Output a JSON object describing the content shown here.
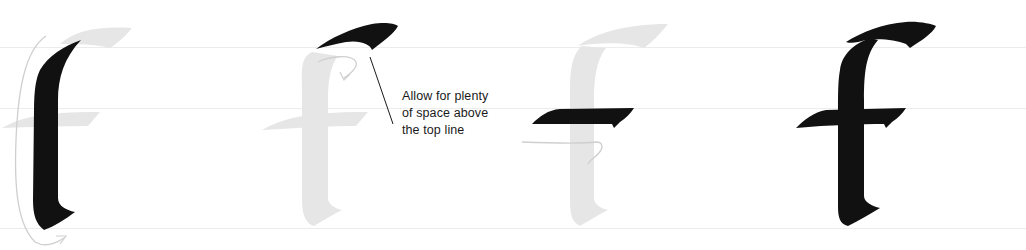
{
  "diagram": {
    "colors": {
      "ink": "#111111",
      "ghost_letter": "#e6e6e6",
      "guide_arrow": "#cfcfcf",
      "guideline": "#ececec",
      "text": "#1a1a1a"
    },
    "guidelines_y": [
      47,
      108,
      228
    ],
    "steps": [
      {
        "index": 1,
        "label": "stroke-1-stem",
        "description": "Vertical stem stroke"
      },
      {
        "index": 2,
        "label": "stroke-2-top-hook",
        "description": "Top hook/flag stroke"
      },
      {
        "index": 3,
        "label": "stroke-3-crossbar",
        "description": "Crossbar stroke"
      },
      {
        "index": 4,
        "label": "completed-letter",
        "description": "Completed letter f"
      }
    ],
    "annotation": {
      "lines": [
        "Allow for plenty",
        "of space above",
        "the top line"
      ]
    }
  }
}
